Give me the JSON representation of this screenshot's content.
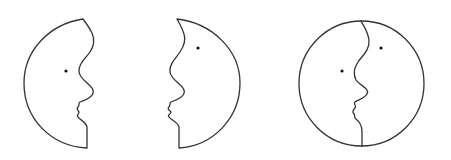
{
  "figure": {
    "stroke_color": "#333333",
    "eye_color": "#111111",
    "background": "#ffffff",
    "panels": [
      {
        "name": "left-profile-face",
        "facing": "right",
        "eyes": 1
      },
      {
        "name": "right-profile-face",
        "facing": "left",
        "eyes": 1
      },
      {
        "name": "combined-circle-faces",
        "facing": "both",
        "eyes": 2
      }
    ]
  }
}
